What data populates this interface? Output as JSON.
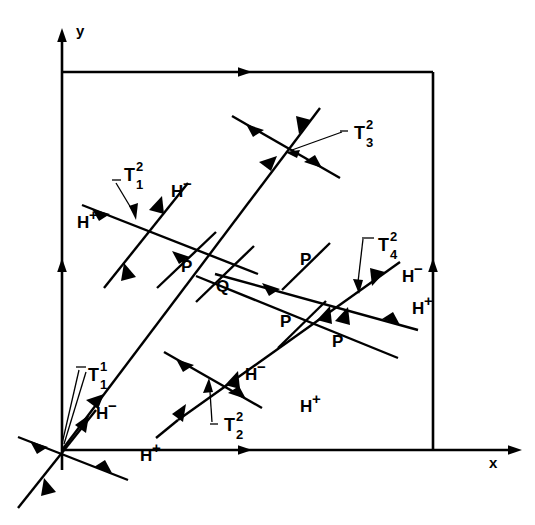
{
  "figure": {
    "kind": "vector-diagram",
    "background_color": "#ffffff",
    "line_color": "#000000",
    "width": 535,
    "height": 525
  },
  "axes": {
    "x_label": "x",
    "y_label": "y",
    "origin": {
      "x": 62,
      "y": 450
    }
  },
  "box": {
    "left": 62,
    "top": 72,
    "right": 433,
    "bottom": 450,
    "top_arrow_at_x": 242,
    "left_arrow_at_y": 265,
    "right_arrow_at_y": 265
  },
  "vertices": [
    {
      "name": "T1_1",
      "base": "T",
      "sub": "1",
      "sup": "1",
      "label_x": 82,
      "label_y": 378,
      "cross_x": 62,
      "cross_y": 450
    },
    {
      "name": "T1_2",
      "base": "T",
      "sub": "1",
      "sup": "2",
      "label_x": 122,
      "label_y": 178,
      "cross_x": 136,
      "cross_y": 222
    },
    {
      "name": "T2_2",
      "base": "T",
      "sub": "2",
      "sup": "2",
      "label_x": 226,
      "label_y": 428,
      "cross_x": 208,
      "cross_y": 380
    },
    {
      "name": "T3_2",
      "base": "T",
      "sub": "3",
      "sup": "2",
      "label_x": 356,
      "label_y": 136,
      "cross_x": 285,
      "cross_y": 146
    },
    {
      "name": "T4_2",
      "base": "T",
      "sub": "4",
      "sup": "2",
      "label_x": 380,
      "label_y": 248,
      "cross_x": 360,
      "cross_y": 296
    }
  ],
  "h_labels": [
    {
      "text": "H",
      "sup": "−",
      "x": 171,
      "y": 197
    },
    {
      "text": "H",
      "sup": "+",
      "x": 77,
      "y": 228
    },
    {
      "text": "H",
      "sup": "−",
      "x": 245,
      "y": 380
    },
    {
      "text": "H",
      "sup": "+",
      "x": 300,
      "y": 412
    },
    {
      "text": "H",
      "sup": "−",
      "x": 402,
      "y": 282
    },
    {
      "text": "H",
      "sup": "+",
      "x": 412,
      "y": 314
    },
    {
      "text": "H",
      "sup": "−",
      "x": 96,
      "y": 419
    },
    {
      "text": "H",
      "sup": "+",
      "x": 140,
      "y": 461
    }
  ],
  "point_labels": [
    {
      "text": "P",
      "x": 181,
      "y": 272
    },
    {
      "text": "Q",
      "x": 216,
      "y": 292
    },
    {
      "text": "P",
      "x": 300,
      "y": 265
    },
    {
      "text": "P",
      "x": 280,
      "y": 327
    },
    {
      "text": "P",
      "x": 332,
      "y": 347
    }
  ],
  "description": {
    "title": "Wave interaction diagram in the x–y plane",
    "summary": "Characteristic lines emanating from the origin vertex T1^1 and intersecting at secondary vertices T1^2, T2^2, T3^2 and T4^2, with H+ and H- characteristic families and intermediate states labelled P and Q."
  }
}
